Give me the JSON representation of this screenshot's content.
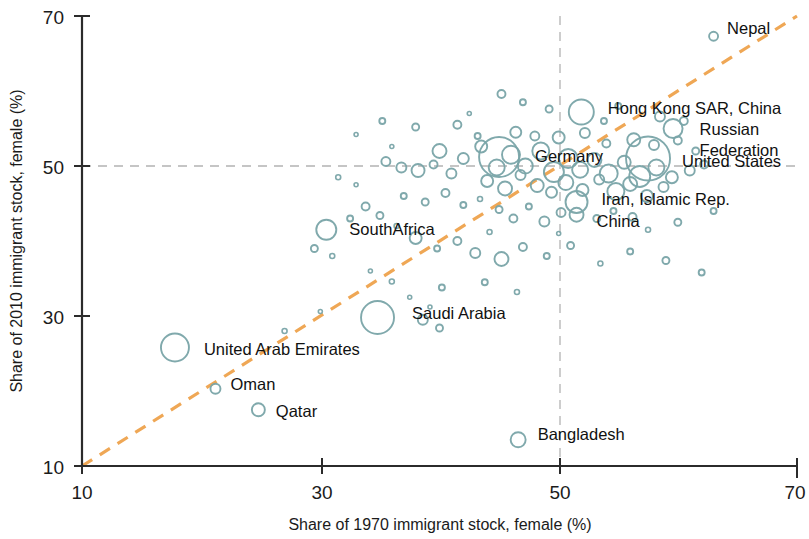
{
  "chart_data": {
    "type": "scatter",
    "title": "",
    "xlabel": "Share of 1970 immigrant stock, female (%)",
    "ylabel": "Share of 2010 immigrant stock, female (%)",
    "xlim": [
      10,
      70
    ],
    "ylim": [
      10,
      70
    ],
    "xticks": [
      10,
      30,
      50,
      70
    ],
    "yticks": [
      10,
      30,
      50,
      70
    ],
    "xtick_labels": [
      "10",
      "30",
      "50",
      "70"
    ],
    "ytick_labels": [
      "10",
      "30",
      "50",
      "70"
    ],
    "grid": "dashed reference lines at x=50 and y=50",
    "legend": "none",
    "reference_line": {
      "name": "45-degree parity line",
      "style": "dashed",
      "color": "#efa755",
      "from": [
        10,
        10
      ],
      "to": [
        70,
        70
      ]
    },
    "marker_style": {
      "shape": "open circle",
      "stroke": "#79a4a8",
      "fill": "none",
      "size_encodes": "immigrant stock size"
    },
    "labeled_points": [
      {
        "label": "Nepal",
        "x": 63.0,
        "y": 67.3,
        "r": 4.5,
        "label_dx": 9,
        "label_dy": -8
      },
      {
        "label": "Hong Kong SAR, China",
        "x": 51.9,
        "y": 57.2,
        "r": 12.5,
        "label_dx": 14,
        "label_dy": -4
      },
      {
        "label": "Russian Federation",
        "x": 59.6,
        "y": 55.0,
        "r": 9.5,
        "label_dx": 17,
        "label_dy": 0
      },
      {
        "label": "United States",
        "x": 57.5,
        "y": 51.0,
        "r": 22.0,
        "label_dx": 12,
        "label_dy": 2
      },
      {
        "label": "Germany",
        "x": 45.0,
        "y": 51.2,
        "r": 20.0,
        "label_dx": 16,
        "label_dy": -1
      },
      {
        "label": "Iran, Islamic Rep.",
        "x": 51.5,
        "y": 45.2,
        "r": 11.0,
        "label_dx": 14,
        "label_dy": -3
      },
      {
        "label": "China",
        "x": 51.5,
        "y": 43.5,
        "r": 7.0,
        "label_dx": 13,
        "label_dy": 6
      },
      {
        "label": "SouthAfrica",
        "x": 30.5,
        "y": 41.5,
        "r": 10.0,
        "label_dx": 13,
        "label_dy": -1
      },
      {
        "label": "Saudi Arabia",
        "x": 34.8,
        "y": 29.8,
        "r": 16.5,
        "label_dx": 18,
        "label_dy": -5
      },
      {
        "label": "United Arab Emirates",
        "x": 17.8,
        "y": 25.8,
        "r": 14.0,
        "label_dx": 15,
        "label_dy": 1
      },
      {
        "label": "Oman",
        "x": 21.2,
        "y": 20.3,
        "r": 5.0,
        "label_dx": 10,
        "label_dy": -5
      },
      {
        "label": "Qatar",
        "x": 24.8,
        "y": 17.5,
        "r": 6.5,
        "label_dx": 11,
        "label_dy": 1
      },
      {
        "label": "Bangladesh",
        "x": 46.6,
        "y": 13.5,
        "r": 7.5,
        "label_dx": 12,
        "label_dy": -6
      }
    ],
    "unlabeled_points": [
      {
        "x": 45.2,
        "y": 59.6,
        "r": 4.0
      },
      {
        "x": 47.0,
        "y": 58.5,
        "r": 3.0
      },
      {
        "x": 49.2,
        "y": 57.6,
        "r": 3.5
      },
      {
        "x": 53.8,
        "y": 56.0,
        "r": 3.0
      },
      {
        "x": 55.0,
        "y": 58.0,
        "r": 3.0
      },
      {
        "x": 58.5,
        "y": 56.6,
        "r": 5.0
      },
      {
        "x": 60.5,
        "y": 56.0,
        "r": 4.0
      },
      {
        "x": 35.2,
        "y": 56.0,
        "r": 3.0
      },
      {
        "x": 38.0,
        "y": 55.2,
        "r": 3.5
      },
      {
        "x": 33.0,
        "y": 54.2,
        "r": 2.0
      },
      {
        "x": 41.5,
        "y": 55.5,
        "r": 4.0
      },
      {
        "x": 43.2,
        "y": 54.0,
        "r": 3.0
      },
      {
        "x": 46.4,
        "y": 54.5,
        "r": 5.5
      },
      {
        "x": 48.0,
        "y": 54.0,
        "r": 4.5
      },
      {
        "x": 50.0,
        "y": 53.8,
        "r": 6.0
      },
      {
        "x": 52.2,
        "y": 54.4,
        "r": 5.0
      },
      {
        "x": 54.0,
        "y": 53.0,
        "r": 4.0
      },
      {
        "x": 56.3,
        "y": 53.5,
        "r": 6.5
      },
      {
        "x": 58.0,
        "y": 52.8,
        "r": 5.0
      },
      {
        "x": 60.0,
        "y": 53.4,
        "r": 4.0
      },
      {
        "x": 61.5,
        "y": 52.0,
        "r": 3.5
      },
      {
        "x": 40.0,
        "y": 52.0,
        "r": 7.0
      },
      {
        "x": 42.0,
        "y": 51.0,
        "r": 5.5
      },
      {
        "x": 43.5,
        "y": 52.6,
        "r": 6.0
      },
      {
        "x": 44.8,
        "y": 49.8,
        "r": 8.0
      },
      {
        "x": 46.0,
        "y": 51.5,
        "r": 9.0
      },
      {
        "x": 47.2,
        "y": 50.0,
        "r": 7.5
      },
      {
        "x": 48.5,
        "y": 52.0,
        "r": 8.5
      },
      {
        "x": 49.6,
        "y": 49.2,
        "r": 10.0
      },
      {
        "x": 50.8,
        "y": 51.0,
        "r": 9.5
      },
      {
        "x": 51.8,
        "y": 49.5,
        "r": 8.0
      },
      {
        "x": 53.0,
        "y": 50.8,
        "r": 7.0
      },
      {
        "x": 54.2,
        "y": 49.0,
        "r": 9.0
      },
      {
        "x": 55.5,
        "y": 50.5,
        "r": 6.5
      },
      {
        "x": 56.8,
        "y": 48.6,
        "r": 10.5
      },
      {
        "x": 58.2,
        "y": 49.8,
        "r": 8.0
      },
      {
        "x": 59.5,
        "y": 48.5,
        "r": 6.0
      },
      {
        "x": 61.0,
        "y": 49.4,
        "r": 5.0
      },
      {
        "x": 62.2,
        "y": 50.2,
        "r": 4.0
      },
      {
        "x": 44.0,
        "y": 48.0,
        "r": 6.0
      },
      {
        "x": 45.5,
        "y": 47.0,
        "r": 7.0
      },
      {
        "x": 46.8,
        "y": 48.8,
        "r": 5.0
      },
      {
        "x": 48.2,
        "y": 47.4,
        "r": 6.5
      },
      {
        "x": 49.4,
        "y": 46.5,
        "r": 5.5
      },
      {
        "x": 50.6,
        "y": 47.8,
        "r": 7.5
      },
      {
        "x": 52.0,
        "y": 46.8,
        "r": 6.0
      },
      {
        "x": 53.4,
        "y": 48.2,
        "r": 5.0
      },
      {
        "x": 54.8,
        "y": 46.6,
        "r": 8.5
      },
      {
        "x": 56.0,
        "y": 47.6,
        "r": 7.0
      },
      {
        "x": 57.4,
        "y": 46.0,
        "r": 6.0
      },
      {
        "x": 58.8,
        "y": 47.2,
        "r": 5.0
      },
      {
        "x": 41.0,
        "y": 49.0,
        "r": 5.0
      },
      {
        "x": 39.5,
        "y": 50.2,
        "r": 4.0
      },
      {
        "x": 38.2,
        "y": 49.4,
        "r": 6.5
      },
      {
        "x": 36.8,
        "y": 49.8,
        "r": 5.0
      },
      {
        "x": 35.5,
        "y": 50.6,
        "r": 4.5
      },
      {
        "x": 37.0,
        "y": 46.0,
        "r": 3.0
      },
      {
        "x": 38.8,
        "y": 45.2,
        "r": 3.5
      },
      {
        "x": 40.5,
        "y": 46.4,
        "r": 4.0
      },
      {
        "x": 42.0,
        "y": 44.8,
        "r": 3.0
      },
      {
        "x": 43.4,
        "y": 45.6,
        "r": 2.5
      },
      {
        "x": 45.0,
        "y": 44.2,
        "r": 3.5
      },
      {
        "x": 46.2,
        "y": 43.0,
        "r": 4.0
      },
      {
        "x": 47.5,
        "y": 44.6,
        "r": 3.0
      },
      {
        "x": 48.8,
        "y": 42.6,
        "r": 5.0
      },
      {
        "x": 50.2,
        "y": 43.8,
        "r": 4.5
      },
      {
        "x": 53.2,
        "y": 43.0,
        "r": 3.5
      },
      {
        "x": 54.6,
        "y": 44.0,
        "r": 3.0
      },
      {
        "x": 56.2,
        "y": 43.2,
        "r": 4.0
      },
      {
        "x": 60.0,
        "y": 42.5,
        "r": 3.5
      },
      {
        "x": 63.0,
        "y": 44.0,
        "r": 3.0
      },
      {
        "x": 33.8,
        "y": 44.6,
        "r": 4.0
      },
      {
        "x": 32.5,
        "y": 43.0,
        "r": 3.0
      },
      {
        "x": 35.0,
        "y": 43.4,
        "r": 3.5
      },
      {
        "x": 36.4,
        "y": 42.0,
        "r": 2.5
      },
      {
        "x": 29.5,
        "y": 39.0,
        "r": 3.5
      },
      {
        "x": 31.0,
        "y": 38.0,
        "r": 2.5
      },
      {
        "x": 38.0,
        "y": 40.4,
        "r": 6.0
      },
      {
        "x": 39.8,
        "y": 39.0,
        "r": 3.0
      },
      {
        "x": 41.5,
        "y": 40.0,
        "r": 4.0
      },
      {
        "x": 43.0,
        "y": 38.4,
        "r": 5.0
      },
      {
        "x": 45.2,
        "y": 37.6,
        "r": 7.0
      },
      {
        "x": 47.0,
        "y": 39.2,
        "r": 4.0
      },
      {
        "x": 49.0,
        "y": 38.0,
        "r": 3.0
      },
      {
        "x": 51.0,
        "y": 39.4,
        "r": 3.5
      },
      {
        "x": 53.5,
        "y": 37.0,
        "r": 2.5
      },
      {
        "x": 56.0,
        "y": 38.6,
        "r": 3.0
      },
      {
        "x": 59.0,
        "y": 37.4,
        "r": 3.5
      },
      {
        "x": 62.0,
        "y": 35.8,
        "r": 3.0
      },
      {
        "x": 43.8,
        "y": 34.5,
        "r": 3.0
      },
      {
        "x": 46.5,
        "y": 33.2,
        "r": 2.5
      },
      {
        "x": 40.2,
        "y": 33.8,
        "r": 3.0
      },
      {
        "x": 37.5,
        "y": 32.5,
        "r": 2.0
      },
      {
        "x": 36.0,
        "y": 34.6,
        "r": 2.5
      },
      {
        "x": 34.2,
        "y": 36.0,
        "r": 2.0
      },
      {
        "x": 38.6,
        "y": 29.5,
        "r": 5.0
      },
      {
        "x": 40.0,
        "y": 28.4,
        "r": 3.5
      },
      {
        "x": 39.2,
        "y": 31.2,
        "r": 2.0
      },
      {
        "x": 30.0,
        "y": 30.6,
        "r": 2.0
      },
      {
        "x": 27.0,
        "y": 28.0,
        "r": 2.5
      },
      {
        "x": 44.2,
        "y": 41.2,
        "r": 2.5
      },
      {
        "x": 50.0,
        "y": 41.0,
        "r": 2.0
      },
      {
        "x": 57.5,
        "y": 41.5,
        "r": 2.5
      },
      {
        "x": 33.0,
        "y": 47.5,
        "r": 2.0
      },
      {
        "x": 31.5,
        "y": 48.5,
        "r": 2.5
      },
      {
        "x": 42.5,
        "y": 57.0,
        "r": 2.0
      },
      {
        "x": 36.0,
        "y": 52.6,
        "r": 2.0
      }
    ]
  },
  "axes": {
    "x_title": "Share of 1970 immigrant stock, female (%)",
    "y_title": "Share of 2010 immigrant stock, female (%)",
    "x_ticks": [
      "10",
      "30",
      "50",
      "70"
    ],
    "y_ticks": [
      "70",
      "50",
      "30",
      "10"
    ]
  },
  "colors": {
    "marker_stroke": "#79a4a8",
    "reference_line": "#efa755",
    "axis": "#2b2b2b",
    "gridline": "#b3b3b3",
    "text": "#111111",
    "background": "#ffffff"
  }
}
